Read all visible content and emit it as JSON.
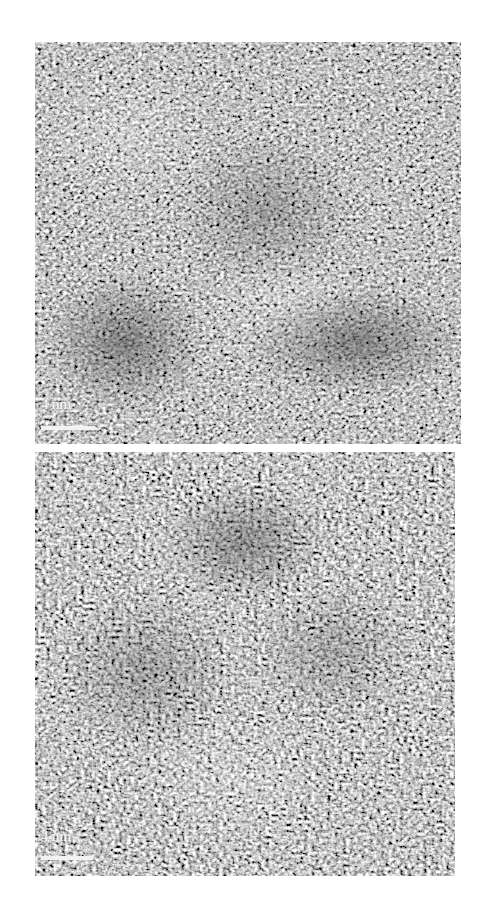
{
  "figure": {
    "panels": [
      {
        "id": "top",
        "description": "HRTEM lattice image",
        "scale_bar": {
          "label": "4 nm"
        }
      },
      {
        "id": "bottom",
        "description": "HRTEM lattice image",
        "scale_bar": {
          "label": "4 nm"
        }
      }
    ],
    "colors": {
      "background": "#ffffff",
      "scale_bar": "#f2f2f2"
    }
  }
}
